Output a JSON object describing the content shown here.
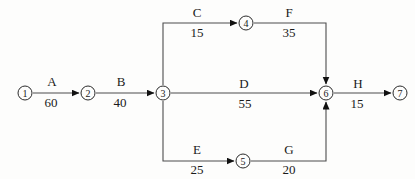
{
  "diagram": {
    "type": "activity-on-arrow-network",
    "nodes": [
      "1",
      "2",
      "3",
      "4",
      "5",
      "6",
      "7"
    ],
    "activities": [
      {
        "name": "A",
        "duration": "60",
        "from": "1",
        "to": "2"
      },
      {
        "name": "B",
        "duration": "40",
        "from": "2",
        "to": "3"
      },
      {
        "name": "C",
        "duration": "15",
        "from": "3",
        "to": "4"
      },
      {
        "name": "F",
        "duration": "35",
        "from": "4",
        "to": "6"
      },
      {
        "name": "D",
        "duration": "55",
        "from": "3",
        "to": "6"
      },
      {
        "name": "E",
        "duration": "25",
        "from": "3",
        "to": "5"
      },
      {
        "name": "G",
        "duration": "20",
        "from": "5",
        "to": "6"
      },
      {
        "name": "H",
        "duration": "15",
        "from": "6",
        "to": "7"
      }
    ],
    "colors": {
      "line": "#4d4d4d",
      "arrowhead": "#111111",
      "node_stroke": "#2b2b2b",
      "text": "#1a1a1a",
      "background": "#fdfdfc"
    }
  }
}
